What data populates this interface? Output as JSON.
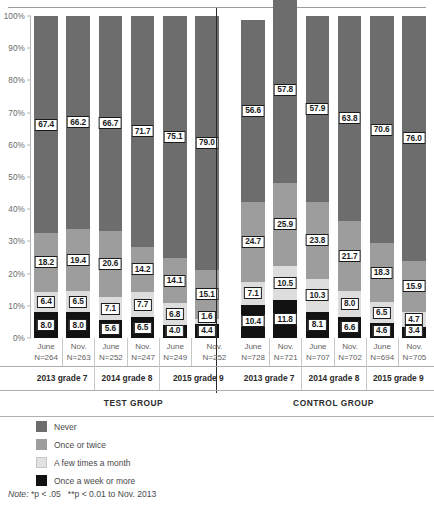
{
  "chart_data": {
    "type": "bar",
    "title": "",
    "subtitle": "",
    "xlabel": "",
    "ylabel": "",
    "ylim": [
      0,
      100
    ],
    "grid": false,
    "stacked": true,
    "stacked_percent": true,
    "legend_position": "bottom-left",
    "y_ticks": [
      "0%",
      "10%",
      "20%",
      "30%",
      "40%",
      "50%",
      "60%",
      "70%",
      "80%",
      "90%",
      "100%"
    ],
    "legend": [
      "Never",
      "Once or twice",
      "A few times a month",
      "Once a week or more"
    ],
    "series_colors": {
      "never": "#6d6d6d",
      "once_or_twice": "#9d9d9d",
      "a_few_times_a_month": "#dddddd",
      "once_a_week_or_more": "#121212"
    },
    "categories": [
      "June N=264",
      "Nov. N=263",
      "June N=252",
      "Nov. N=247",
      "June N=249",
      "Nov. N=252",
      "June N=728",
      "Nov. N=721",
      "June N=707",
      "Nov. N=702",
      "June N=694",
      "Nov. N=705"
    ],
    "series": [
      {
        "name": "Never",
        "values": [
          67.4,
          66.2,
          66.7,
          71.7,
          75.1,
          79.0,
          56.6,
          57.8,
          57.9,
          63.8,
          70.6,
          76.0
        ]
      },
      {
        "name": "Once or twice",
        "values": [
          18.2,
          19.4,
          20.6,
          14.2,
          14.1,
          15.1,
          24.7,
          25.9,
          23.8,
          21.7,
          18.3,
          15.9
        ]
      },
      {
        "name": "A few times a month",
        "values": [
          6.4,
          6.5,
          7.1,
          7.7,
          6.8,
          1.6,
          7.1,
          10.5,
          10.3,
          8.0,
          6.5,
          4.7
        ]
      },
      {
        "name": "Once a week or more",
        "values": [
          8.0,
          8.0,
          5.6,
          6.5,
          4.0,
          4.4,
          10.4,
          11.8,
          8.1,
          6.6,
          4.6,
          3.4
        ]
      }
    ],
    "note": "Note: *p < .05   **p < 0.01 to Nov. 2013"
  },
  "axis": {
    "y_ticks": [
      "100%",
      "90%",
      "80%",
      "70%",
      "60%",
      "50%",
      "40%",
      "30%",
      "20%",
      "10%",
      "0%"
    ]
  },
  "bars": [
    {
      "id": "test-2013-june",
      "month": "June",
      "n": "N=264",
      "never": "67.4",
      "twice": "18.2",
      "month_few": "6.4",
      "week": "8.0"
    },
    {
      "id": "test-2013-nov",
      "month": "Nov.",
      "n": "N=263",
      "never": "66.2",
      "twice": "19.4",
      "month_few": "6.5",
      "week": "8.0"
    },
    {
      "id": "test-2014-june",
      "month": "June",
      "n": "N=252",
      "never": "66.7",
      "twice": "20.6",
      "month_few": "7.1",
      "week": "5.6"
    },
    {
      "id": "test-2014-nov",
      "month": "Nov.",
      "n": "N=247",
      "never": "71.7",
      "twice": "14.2",
      "month_few": "7.7",
      "week": "6.5"
    },
    {
      "id": "test-2015-june",
      "month": "June",
      "n": "N=249",
      "never": "75.1",
      "twice": "14.1",
      "month_few": "6.8",
      "week": "4.0"
    },
    {
      "id": "test-2015-nov",
      "month": "Nov.",
      "n": "N=252",
      "never": "79.0",
      "twice": "15.1",
      "month_few": "1.6",
      "week": "4.4"
    },
    {
      "id": "control-2013-june",
      "month": "June",
      "n": "N=728",
      "never": "56.6",
      "twice": "24.7",
      "month_few": "7.1",
      "week": "10.4"
    },
    {
      "id": "control-2013-nov",
      "month": "Nov.",
      "n": "N=721",
      "never": "57.8",
      "twice": "25.9",
      "month_few": "10.5",
      "week": "11.8"
    },
    {
      "id": "control-2014-june",
      "month": "June",
      "n": "N=707",
      "never": "57.9",
      "twice": "23.8",
      "month_few": "10.3",
      "week": "8.1"
    },
    {
      "id": "control-2014-nov",
      "month": "Nov.",
      "n": "N=702",
      "never": "63.8",
      "twice": "21.7",
      "month_few": "8.0",
      "week": "6.6"
    },
    {
      "id": "control-2015-june",
      "month": "June",
      "n": "N=694",
      "never": "70.6",
      "twice": "18.3",
      "month_few": "6.5",
      "week": "4.6"
    },
    {
      "id": "control-2015-nov",
      "month": "Nov.",
      "n": "N=705",
      "never": "76.0",
      "twice": "15.9",
      "month_few": "4.7",
      "week": "3.4"
    }
  ],
  "grades": [
    "2013 grade 7",
    "2014 grade 8",
    "2015 grade 9",
    "2013 grade 7",
    "2014 grade 8",
    "2015 grade 9"
  ],
  "groups": [
    "TEST GROUP",
    "CONTROL GROUP"
  ],
  "legend": [
    {
      "key": "never",
      "label": "Never"
    },
    {
      "key": "twice",
      "label": "Once or twice"
    },
    {
      "key": "month",
      "label": "A few times a month"
    },
    {
      "key": "week",
      "label": "Once a week or more"
    }
  ],
  "note": {
    "prefix": "Note:",
    "body_1": "*p < .05",
    "body_2": "**p < 0.01 to Nov. 2013"
  }
}
